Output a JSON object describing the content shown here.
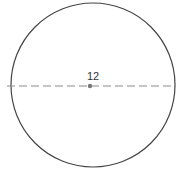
{
  "diagram": {
    "shape": "circle",
    "center_label": "12",
    "colors": {
      "outline": "#444444",
      "diameter_line": "#888888",
      "center_dot": "#777777",
      "label": "#333333"
    }
  }
}
